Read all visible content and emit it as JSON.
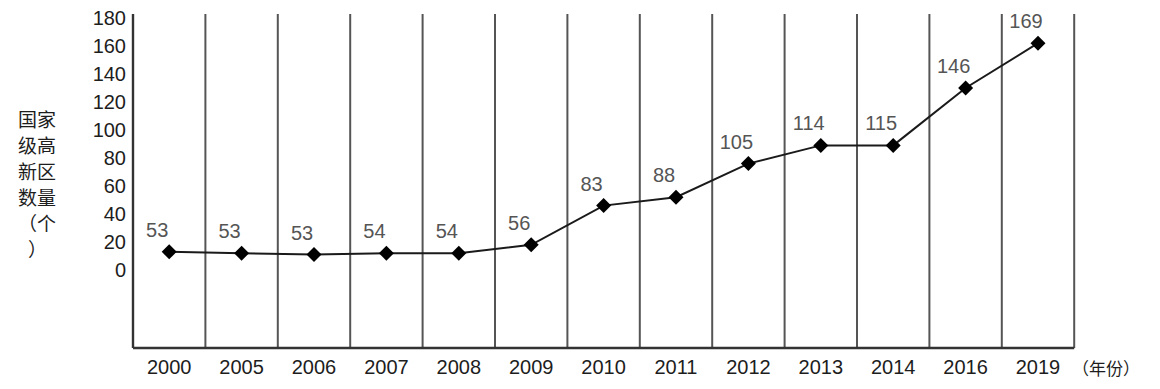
{
  "chart_data": {
    "type": "line",
    "title": "",
    "subtitle": "",
    "xlabel": "（年份）",
    "ylabel": "国家级高新区数量（个）",
    "categories": [
      "2000",
      "2005",
      "2006",
      "2007",
      "2008",
      "2009",
      "2010",
      "2011",
      "2012",
      "2013",
      "2014",
      "2016",
      "2019"
    ],
    "values": [
      53,
      53,
      53,
      54,
      54,
      56,
      83,
      88,
      105,
      114,
      115,
      146,
      169
    ],
    "data_labels": [
      "53",
      "53",
      "53",
      "54",
      "54",
      "56",
      "83",
      "88",
      "105",
      "114",
      "115",
      "146",
      "169"
    ],
    "series": [
      {
        "name": "国家级高新区数量",
        "values": [
          53,
          53,
          53,
          54,
          54,
          56,
          83,
          88,
          105,
          114,
          115,
          146,
          169
        ]
      }
    ],
    "ylim": [
      0,
      180
    ],
    "ytick_labels": [
      "180",
      "160",
      "140",
      "120",
      "100",
      "80",
      "60",
      "40",
      "20",
      "0"
    ],
    "ytick_values": [
      180,
      160,
      140,
      120,
      100,
      80,
      60,
      40,
      20,
      0
    ],
    "ytick_step": 20,
    "grid": "vertical",
    "legend": "none",
    "marker": "diamond",
    "line_color": "#1a1a1a",
    "marker_color": "#000000",
    "grid_color": "#555555",
    "axis_color": "#333333",
    "label_color": "#555555",
    "background": "#ffffff",
    "plotted_positions": [
      13,
      12,
      11,
      12,
      12,
      18,
      46,
      52,
      76,
      89,
      89,
      130,
      162
    ]
  }
}
